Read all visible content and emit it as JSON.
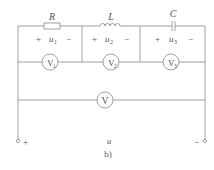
{
  "figure": {
    "caption": "b)",
    "source_voltage_label": "u",
    "terminals": {
      "positive": "+",
      "negative": "−"
    },
    "colors": {
      "line": "#888888",
      "text": "#555555"
    }
  },
  "components": [
    {
      "type": "resistor",
      "label": "R",
      "voltage_label": "u",
      "voltage_sub": "1",
      "plus": "+",
      "minus": "−",
      "voltmeter": "V",
      "voltmeter_sub": "1"
    },
    {
      "type": "inductor",
      "label": "L",
      "voltage_label": "u",
      "voltage_sub": "2",
      "plus": "+",
      "minus": "−",
      "voltmeter": "V",
      "voltmeter_sub": "2"
    },
    {
      "type": "capacitor",
      "label": "C",
      "voltage_label": "u",
      "voltage_sub": "3",
      "plus": "+",
      "minus": "−",
      "voltmeter": "V",
      "voltmeter_sub": "3"
    }
  ],
  "total_voltmeter": {
    "label": "V"
  }
}
